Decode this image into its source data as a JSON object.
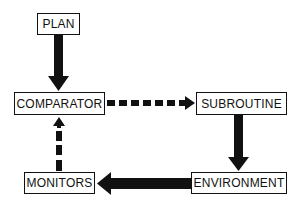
{
  "diagram": {
    "nodes": [
      {
        "id": "plan",
        "label": "PLAN"
      },
      {
        "id": "comparator",
        "label": "COMPARATOR"
      },
      {
        "id": "subroutine",
        "label": "SUBROUTINE"
      },
      {
        "id": "environment",
        "label": "ENVIRONMENT"
      },
      {
        "id": "monitors",
        "label": "MONITORS"
      }
    ],
    "edges": [
      {
        "from": "plan",
        "to": "comparator",
        "style": "solid"
      },
      {
        "from": "comparator",
        "to": "subroutine",
        "style": "dashed"
      },
      {
        "from": "subroutine",
        "to": "environment",
        "style": "solid"
      },
      {
        "from": "environment",
        "to": "monitors",
        "style": "solid"
      },
      {
        "from": "monitors",
        "to": "comparator",
        "style": "dashed"
      }
    ],
    "colors": {
      "stroke": "#111111",
      "background": "#ffffff"
    }
  }
}
